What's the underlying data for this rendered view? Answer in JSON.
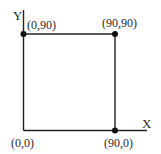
{
  "diagram": {
    "type": "coordinate-square",
    "axes": {
      "x_label": "X",
      "y_label": "Y"
    },
    "points": [
      {
        "label": "(0,0)",
        "x": 0,
        "y": 0,
        "marked": false
      },
      {
        "label": "(0,90)",
        "x": 0,
        "y": 90,
        "marked": true
      },
      {
        "label": "(90,90)",
        "x": 90,
        "y": 90,
        "marked": true
      },
      {
        "label": "(90,0)",
        "x": 90,
        "y": 0,
        "marked": true
      }
    ],
    "colors": {
      "line": "#222222",
      "dot": "#111111",
      "text": "#2a2a2a",
      "background": "#ffffff"
    }
  }
}
